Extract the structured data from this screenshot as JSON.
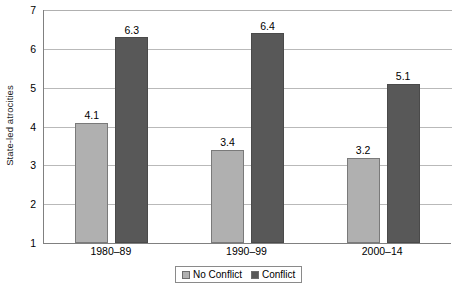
{
  "chart_data": {
    "type": "bar",
    "title": "",
    "xlabel": "",
    "ylabel": "State-led atrocities",
    "categories": [
      "1980–89",
      "1990–99",
      "2000–14"
    ],
    "series": [
      {
        "name": "No Conflict",
        "color": "#b0b0b0",
        "values": [
          4.1,
          3.4,
          3.2
        ]
      },
      {
        "name": "Conflict",
        "color": "#585858",
        "values": [
          6.3,
          6.4,
          5.1
        ]
      }
    ],
    "ylim": [
      1,
      7
    ],
    "yticks": [
      1,
      2,
      3,
      4,
      5,
      6,
      7
    ],
    "ytick_labels": [
      "1",
      "2",
      "3",
      "4",
      "5",
      "6",
      "7"
    ],
    "data_labels": [
      "4.1",
      "6.3",
      "3.4",
      "6.4",
      "3.2",
      "5.1"
    ],
    "grid": "horizontal",
    "legend_position": "bottom-center",
    "legend_entries": [
      "No Conflict",
      "Conflict"
    ]
  }
}
